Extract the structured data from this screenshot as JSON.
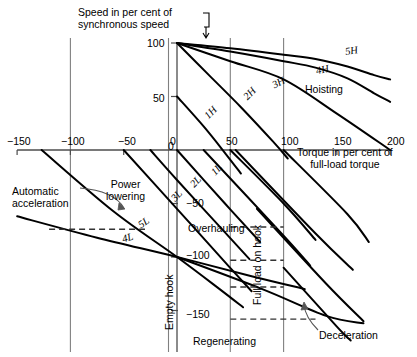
{
  "figure": {
    "domain": "Chart",
    "background_color": "#ffffff",
    "line_color": "#000000",
    "axis_color": "#4d4d4d",
    "grid_color": "#808080"
  },
  "axes": {
    "y_title_line1": "Speed in per cent of",
    "y_title_line2": "synchronous speed",
    "x_title_line1": "Torque in per cent of",
    "x_title_line2": "full-load torque",
    "x_ticks": [
      "−150",
      "−100",
      "−50",
      "0",
      "50",
      "100",
      "150",
      "200"
    ],
    "x_tick_values": [
      -150,
      -100,
      -50,
      0,
      50,
      100,
      150,
      200
    ],
    "y_ticks": [
      "100",
      "50",
      "0",
      "−50",
      "−100",
      "−150"
    ],
    "y_tick_values": [
      100,
      50,
      0,
      -50,
      -100,
      -150
    ],
    "xlim": [
      -150,
      200
    ],
    "ylim": [
      -175,
      100
    ]
  },
  "annotations": {
    "hoisting": "Hoisting",
    "power_lowering_line1": "Power",
    "power_lowering_line2": "lowering",
    "overhauling": "Overhauling",
    "regenerating": "Regenerating",
    "empty_hook": "Empty hook",
    "full_load_on_hook": "Full load on hook",
    "automatic_acceleration_line1": "Automatic",
    "automatic_acceleration_line2": "acceleration",
    "deceleration": "Deceleration"
  },
  "chart_data": {
    "type": "line",
    "xlabel": "Torque in per cent of full-load torque",
    "ylabel": "Speed in per cent of synchronous speed",
    "xlim": [
      -150,
      200
    ],
    "ylim": [
      -175,
      100
    ],
    "grid": false,
    "legend": "inline-curve-labels",
    "vertical_reference_lines": [
      {
        "name": "minus-100-torque",
        "x": -100
      },
      {
        "name": "empty-hook",
        "x": -8,
        "label": "Empty hook"
      },
      {
        "name": "zero-torque-axis",
        "x": 0
      },
      {
        "name": "full-load-on-hook",
        "x": 50,
        "label": "Full load on hook"
      },
      {
        "name": "plus-100-torque",
        "x": 100
      }
    ],
    "series": [
      {
        "name": "5H",
        "kind": "hoisting",
        "points": [
          [
            0,
            100
          ],
          [
            50,
            95
          ],
          [
            100,
            89
          ],
          [
            130,
            85
          ],
          [
            160,
            78
          ],
          [
            185,
            70
          ],
          [
            200,
            66
          ]
        ]
      },
      {
        "name": "4H",
        "kind": "hoisting",
        "points": [
          [
            0,
            100
          ],
          [
            50,
            92
          ],
          [
            100,
            83
          ],
          [
            130,
            77
          ],
          [
            160,
            67
          ],
          [
            185,
            53
          ],
          [
            200,
            45
          ]
        ]
      },
      {
        "name": "3H",
        "kind": "hoisting",
        "points": [
          [
            0,
            100
          ],
          [
            50,
            83
          ],
          [
            100,
            66
          ],
          [
            150,
            34
          ],
          [
            200,
            0
          ]
        ]
      },
      {
        "name": "2H",
        "kind": "hoisting",
        "points": [
          [
            0,
            100
          ],
          [
            30,
            70
          ],
          [
            60,
            40
          ],
          [
            90,
            8
          ],
          [
            104,
            -8
          ]
        ]
      },
      {
        "name": "1H",
        "kind": "hoisting",
        "points": [
          [
            0,
            50
          ],
          [
            25,
            22
          ],
          [
            46,
            -4
          ],
          [
            60,
            -22
          ]
        ]
      },
      {
        "name": "1L",
        "kind": "lowering",
        "points": [
          [
            0,
            0
          ],
          [
            45,
            -50
          ],
          [
            78,
            -86
          ]
        ]
      },
      {
        "name": "2L",
        "kind": "lowering",
        "points": [
          [
            -25,
            0
          ],
          [
            0,
            -28
          ],
          [
            45,
            -77
          ],
          [
            68,
            -102
          ]
        ]
      },
      {
        "name": "3L",
        "kind": "lowering",
        "points": [
          [
            -50,
            0
          ],
          [
            0,
            -55
          ],
          [
            48,
            -108
          ],
          [
            70,
            -132
          ]
        ]
      },
      {
        "name": "5L",
        "kind": "lowering",
        "points": [
          [
            -127,
            0
          ],
          [
            -60,
            -57
          ],
          [
            0,
            -100
          ],
          [
            40,
            -130
          ],
          [
            62,
            -147
          ]
        ]
      },
      {
        "name": "4L",
        "kind": "lowering",
        "points": [
          [
            -150,
            -62
          ],
          [
            -75,
            -82
          ],
          [
            0,
            -100
          ],
          [
            70,
            -118
          ],
          [
            120,
            -130
          ]
        ]
      },
      {
        "name": "1L-b",
        "kind": "lowering-branch",
        "points": [
          [
            50,
            0
          ],
          [
            100,
            -50
          ],
          [
            130,
            -84
          ]
        ]
      },
      {
        "name": "2L-b",
        "kind": "lowering-branch",
        "points": [
          [
            25,
            0
          ],
          [
            100,
            -80
          ],
          [
            125,
            -108
          ]
        ]
      },
      {
        "name": "3L-b",
        "kind": "lowering-branch",
        "points": [
          [
            100,
            0
          ],
          [
            160,
            -60
          ],
          [
            180,
            -86
          ]
        ]
      },
      {
        "name": "5L-b",
        "kind": "lowering-branch",
        "points": [
          [
            55,
            0
          ],
          [
            130,
            -78
          ],
          [
            165,
            -112
          ]
        ]
      },
      {
        "name": "4L-b",
        "kind": "lowering-branch",
        "points": [
          [
            0,
            -100
          ],
          [
            80,
            -130
          ],
          [
            140,
            -155
          ],
          [
            175,
            -162
          ]
        ]
      },
      {
        "name": "decel-a",
        "kind": "lowering-branch",
        "points": [
          [
            75,
            -55
          ],
          [
            140,
            -125
          ],
          [
            175,
            -160
          ]
        ]
      },
      {
        "name": "decel-b",
        "kind": "lowering-branch",
        "points": [
          [
            100,
            -110
          ],
          [
            150,
            -165
          ],
          [
            163,
            -178
          ]
        ]
      }
    ],
    "dashed_leaders": [
      {
        "name": "auto-accel-leader",
        "x1": -120,
        "y1": -74,
        "x2": -30,
        "y2": -74
      },
      {
        "name": "fullload-leader-1",
        "x1": 50,
        "y1": -72,
        "x2": 100,
        "y2": -72
      },
      {
        "name": "fullload-leader-2",
        "x1": 50,
        "y1": -103,
        "x2": 100,
        "y2": -103
      },
      {
        "name": "fullload-leader-3",
        "x1": 50,
        "y1": -128,
        "x2": 100,
        "y2": -128
      },
      {
        "name": "decel-leader",
        "x1": 50,
        "y1": -158,
        "x2": 130,
        "y2": -158
      }
    ]
  }
}
